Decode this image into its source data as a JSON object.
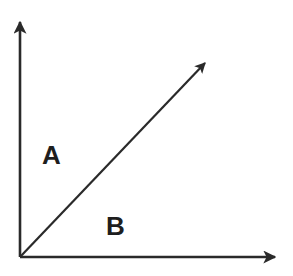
{
  "diagram": {
    "type": "axes-with-diagonal-vector",
    "colors": {
      "stroke": "#2a2a2a",
      "text": "#1e1e1e",
      "background": "#ffffff"
    },
    "origin": [
      20,
      257
    ],
    "y_axis_tip": [
      20,
      20
    ],
    "x_axis_tip": [
      277,
      257
    ],
    "diagonal_tip": [
      207,
      61
    ],
    "regions": [
      {
        "id": "A",
        "label": "A",
        "position": "above diagonal"
      },
      {
        "id": "B",
        "label": "B",
        "position": "below diagonal"
      }
    ]
  }
}
